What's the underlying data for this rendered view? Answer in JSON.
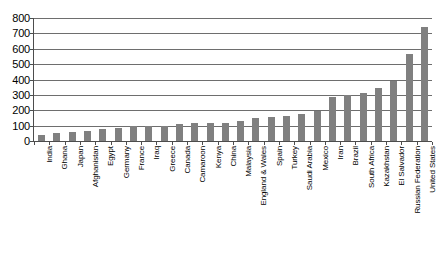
{
  "chart_data": {
    "type": "bar",
    "title": "",
    "subtitle": "",
    "xlabel": "",
    "ylabel": "",
    "ylim": [
      0,
      800
    ],
    "y_ticks": [
      0,
      100,
      200,
      300,
      400,
      500,
      600,
      700,
      800
    ],
    "y_tick_labels": [
      "0",
      "100",
      "200",
      "300",
      "400",
      "500",
      "600",
      "700",
      "800"
    ],
    "grid": true,
    "legend": "none",
    "bar_color": "#808080",
    "axis_color": "#4d4d4d",
    "gridline_color": "#6e6e6e",
    "categories": [
      "India",
      "Ghana",
      "Japan",
      "Afghanistan",
      "Egypt",
      "Germany",
      "France",
      "Iraq",
      "Greece",
      "Canada",
      "Camaroon",
      "Kenya",
      "China",
      "Malaysia",
      "England & Wales",
      "Spain",
      "Turkey",
      "Saudi Arabia",
      "Mexico",
      "Iran",
      "Brazil",
      "South Africa",
      "Kazakhstan",
      "El Salvador",
      "Russian Federation",
      "United States"
    ],
    "values": [
      40,
      52,
      57,
      62,
      78,
      85,
      98,
      100,
      100,
      113,
      117,
      118,
      118,
      133,
      148,
      155,
      165,
      175,
      197,
      287,
      298,
      315,
      347,
      390,
      565,
      740
    ]
  }
}
